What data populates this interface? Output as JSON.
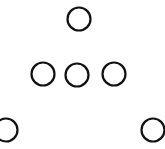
{
  "diagram": {
    "stroke_color": "#111111",
    "background": "#ffffff",
    "circles": [
      {
        "id": "top",
        "cx": 79,
        "cy": 19,
        "r": 11.5
      },
      {
        "id": "middle-left",
        "cx": 43,
        "cy": 74,
        "r": 11.5
      },
      {
        "id": "middle-center",
        "cx": 77,
        "cy": 75,
        "r": 11.5
      },
      {
        "id": "middle-right",
        "cx": 114,
        "cy": 74,
        "r": 11.5
      },
      {
        "id": "bottom-left",
        "cx": 6,
        "cy": 130,
        "r": 11.5
      },
      {
        "id": "bottom-right",
        "cx": 153,
        "cy": 130,
        "r": 11.5
      }
    ]
  }
}
